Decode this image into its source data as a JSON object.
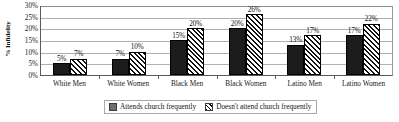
{
  "chart_data": {
    "type": "bar",
    "title": "",
    "xlabel": "",
    "ylabel": "% Infidelity",
    "ylim": [
      0,
      30
    ],
    "ytick_labels": [
      "30%",
      "25%",
      "20%",
      "15%",
      "10%",
      "5%",
      "0%"
    ],
    "ytick_values": [
      30,
      25,
      20,
      15,
      10,
      5,
      0
    ],
    "grid": true,
    "legend_position": "bottom-center",
    "categories": [
      "White Men",
      "White Women",
      "Black Men",
      "Black Women",
      "Latino Men",
      "Latino Women"
    ],
    "series": [
      {
        "name": "Attends church frequently",
        "pattern": "solid",
        "values": [
          5,
          7,
          15,
          20,
          13,
          17
        ],
        "labels": [
          "5%",
          "7%",
          "15%",
          "20%",
          "13%",
          "17%"
        ]
      },
      {
        "name": "Doesn't attend church frequently",
        "pattern": "diagonal-hatch",
        "values": [
          7,
          10,
          20,
          26,
          17,
          22
        ],
        "labels": [
          "7%",
          "10%",
          "20%",
          "26%",
          "17%",
          "22%"
        ]
      }
    ]
  },
  "legend": {
    "entries": [
      {
        "label": "Attends church frequently"
      },
      {
        "label": "Doesn't attend church frequently"
      }
    ]
  },
  "colors": {
    "series_solid": "#1c1c1c",
    "series_hatch_line": "#111111",
    "gridline": "#b0b0b0",
    "axis": "#5a5a5a",
    "text": "#111111",
    "background": "#ffffff"
  }
}
